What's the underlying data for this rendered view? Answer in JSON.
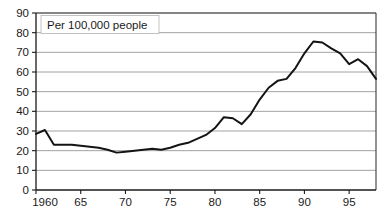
{
  "chart_data": {
    "type": "line",
    "title": "Per 100,000 people",
    "xlabel": "",
    "ylabel": "",
    "grid": true,
    "legend": false,
    "xlim": [
      1960,
      1998
    ],
    "ylim": [
      0,
      90
    ],
    "y_ticks": [
      0,
      10,
      20,
      30,
      40,
      50,
      60,
      70,
      80,
      90
    ],
    "y_tick_labels": [
      "0",
      "10",
      "20",
      "30",
      "40",
      "50",
      "60",
      "70",
      "80",
      "90"
    ],
    "x_ticks": [
      1960,
      1965,
      1970,
      1975,
      1980,
      1985,
      1990,
      1995
    ],
    "x_tick_labels": [
      "1960",
      "65",
      "70",
      "75",
      "80",
      "85",
      "90",
      "95"
    ],
    "x": [
      1960,
      1961,
      1962,
      1963,
      1964,
      1965,
      1966,
      1967,
      1968,
      1969,
      1970,
      1971,
      1972,
      1973,
      1974,
      1975,
      1976,
      1977,
      1978,
      1979,
      1980,
      1981,
      1982,
      1983,
      1984,
      1985,
      1986,
      1987,
      1988,
      1989,
      1990,
      1991,
      1992,
      1993,
      1994,
      1995,
      1996,
      1997,
      1998
    ],
    "values": [
      28.5,
      30.5,
      23.0,
      23.0,
      23.0,
      22.5,
      22.0,
      21.5,
      20.5,
      19.0,
      19.5,
      20.0,
      20.5,
      21.0,
      20.5,
      21.5,
      23.0,
      24.0,
      26.0,
      28.0,
      31.5,
      37.0,
      36.5,
      33.5,
      38.5,
      46.0,
      52.0,
      55.5,
      56.5,
      62.0,
      69.5,
      75.5,
      75.0,
      72.0,
      69.5,
      64.0,
      66.5,
      63.0,
      56.5
    ],
    "series_name": "rate"
  },
  "geometry": {
    "plot_left": 36,
    "plot_right": 376,
    "plot_top": 13,
    "plot_bottom": 190
  }
}
